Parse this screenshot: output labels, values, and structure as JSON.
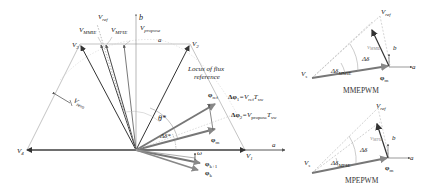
{
  "main_diagram": {
    "vectors": {
      "v1": "V",
      "v1_sub": "1",
      "v2": "V",
      "v2_sub": "2",
      "v3": "V",
      "v3_sub": "3",
      "v4": "V",
      "v4_sub": "4",
      "v_ref": "V",
      "v_ref_sub": "ref",
      "v_mmie": "V",
      "v_mmie_sub": "MMIE",
      "v_mpie": "V",
      "v_mpie_sub": "MPIE",
      "v_propose": "V",
      "v_propose_sub": "propose"
    },
    "axes": {
      "a": "a",
      "b": "b"
    },
    "locus_label_line1": "Locus of flux",
    "locus_label_line2": "reference",
    "theta_label": "θ*",
    "delta_label": "Δδ*",
    "v_zero_label": "V",
    "v_zero_sub": "zero",
    "phi_ref": "φ",
    "phi_ref_sub": "ref",
    "phi_k": "φ",
    "phi_k_sub": "k",
    "phi_k1": "φ",
    "phi_k1_sub": "k+1",
    "phi_m": "φ",
    "phi_m_sub": "m",
    "omega": "ω",
    "eq1_prefix": "Δφ",
    "eq1_sub": "1",
    "eq1_rhs": "=V",
    "eq1_rhs_sub": "ref",
    "eq1_t": "T",
    "eq1_t_sub": "sw",
    "eq2_prefix": "Δφ",
    "eq2_sub": "2",
    "eq2_rhs": "=V",
    "eq2_rhs_sub": "propose",
    "eq2_t": "T",
    "eq2_t_sub": "sw"
  },
  "inset_top": {
    "caption": "MMEPWM",
    "v_ref": "V",
    "v_ref_sub": "ref",
    "v_vec": "V",
    "v_vec_sub": "MMIE",
    "v_s": "V",
    "v_s_sub": "s",
    "delta": "Δδ",
    "delta_sub_label": "Δδ",
    "delta_sub": "MMIE",
    "phi": "φ",
    "phi_sub": "m",
    "axis_a": "a",
    "axis_b": "b"
  },
  "inset_bottom": {
    "caption": "MPEPWM",
    "v_ref": "V",
    "v_ref_sub": "ref",
    "v_vec": "V",
    "v_vec_sub": "MPIE",
    "v_s": "V",
    "v_s_sub": "s",
    "delta": "Δδ",
    "delta_sub_label": "Δδ",
    "delta_sub": "MPIE",
    "phi": "φ",
    "phi_sub": "m",
    "axis_a": "a",
    "axis_b": "b"
  },
  "colors": {
    "line_dark": "#333333",
    "line_gray": "#888888",
    "line_light": "#b0b0b0",
    "text": "#222222"
  }
}
